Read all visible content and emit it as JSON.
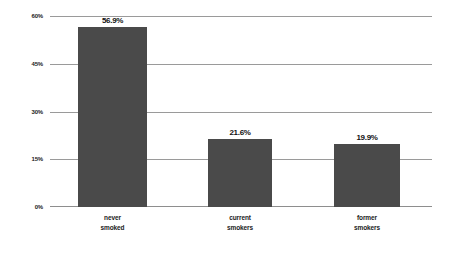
{
  "chart_data": {
    "type": "bar",
    "title": "",
    "subtitle": "",
    "xlabel": "",
    "ylabel": "",
    "categories": [
      "never smoked",
      "current smokers",
      "former smokers"
    ],
    "category_lines": [
      [
        "never",
        "smoked"
      ],
      [
        "current",
        "smokers"
      ],
      [
        "former",
        "smokers"
      ]
    ],
    "values": [
      56.9,
      21.6,
      19.9
    ],
    "value_labels": [
      "56.9%",
      "21.6%",
      "19.9%"
    ],
    "ylim": [
      0,
      60
    ],
    "yticks": [
      0,
      15,
      30,
      45,
      60
    ],
    "ytick_labels": [
      "0%",
      "15%",
      "30%",
      "45%",
      "60%"
    ],
    "grid": true,
    "legend": false,
    "legend_position": "none",
    "colors": {
      "bar": "#4a4a4a",
      "gridline": "#9a9a9a",
      "axis_text": "#1b1b1b",
      "value_text": "#111111",
      "background": "#ffffff"
    }
  }
}
